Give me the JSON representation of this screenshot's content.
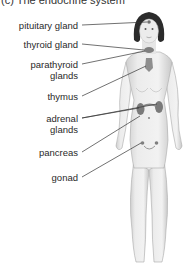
{
  "title": "(c) The endocrine system",
  "labels": {
    "pituitary": "pituitary gland",
    "thyroid": "thyroid gland",
    "parathyroid_1": "parathyroid",
    "parathyroid_2": "glands",
    "thymus": "thymus",
    "adrenal_1": "adrenal",
    "adrenal_2": "glands",
    "pancreas": "pancreas",
    "gonad": "gonad"
  },
  "colors": {
    "gland": "#8a8a8a",
    "leader_line": "#333333",
    "skin": "#e8e8e8"
  }
}
